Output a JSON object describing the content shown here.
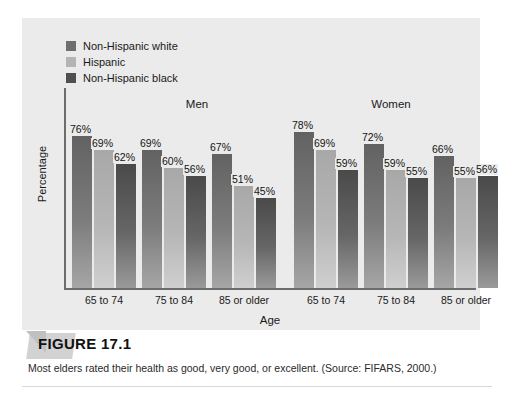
{
  "figure": {
    "number_label": "FIGURE 17.1",
    "caption": "Most elders rated their health as good, very good, or excellent.  (Source: FIFARS, 2000.)"
  },
  "chart_data": {
    "type": "bar",
    "title": "",
    "xlabel": "Age",
    "ylabel": "Percentage",
    "ylim": [
      0,
      100
    ],
    "grid": false,
    "legend_position": "top-left",
    "panels": [
      {
        "name": "Men",
        "label": "Men"
      },
      {
        "name": "Women",
        "label": "Women"
      }
    ],
    "categories": [
      "65 to 74",
      "75 to 84",
      "85 or older",
      "65 to 74",
      "75 to 84",
      "85 or older"
    ],
    "series": [
      {
        "name": "Non-Hispanic white",
        "color": "#6f6f6f",
        "values": [
          76,
          69,
          67,
          78,
          72,
          66
        ]
      },
      {
        "name": "Hispanic",
        "color": "#b4b4b4",
        "values": [
          69,
          60,
          51,
          69,
          59,
          55
        ]
      },
      {
        "name": "Non-Hispanic black",
        "color": "#4f4f4f",
        "values": [
          62,
          56,
          45,
          59,
          55,
          56
        ]
      }
    ],
    "value_labels": [
      "76%",
      "69%",
      "62%",
      "69%",
      "60%",
      "56%",
      "67%",
      "51%",
      "45%",
      "78%",
      "69%",
      "59%",
      "72%",
      "59%",
      "55%",
      "66%",
      "55%",
      "56%"
    ]
  },
  "legend": {
    "items": [
      {
        "label": "Non-Hispanic white",
        "color": "#6f6f6f"
      },
      {
        "label": "Hispanic",
        "color": "#b4b4b4"
      },
      {
        "label": "Non-Hispanic black",
        "color": "#4f4f4f"
      }
    ]
  }
}
